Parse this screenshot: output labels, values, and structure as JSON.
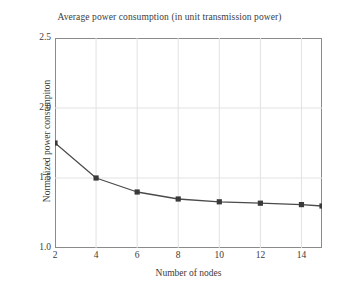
{
  "chart_data": {
    "type": "line",
    "title": "Average power consumption (in unit transmission power)",
    "xlabel": "Number of nodes",
    "ylabel": "Normalized power consumpiton",
    "x": [
      2,
      4,
      6,
      8,
      10,
      12,
      14,
      15
    ],
    "values": [
      1.75,
      1.5,
      1.4,
      1.35,
      1.33,
      1.32,
      1.31,
      1.3
    ],
    "series": [
      {
        "name": "Normalized power consumption",
        "values": [
          1.75,
          1.5,
          1.4,
          1.35,
          1.33,
          1.32,
          1.31,
          1.3
        ]
      }
    ],
    "xlim": [
      2,
      15
    ],
    "ylim": [
      1.0,
      2.5
    ],
    "xticks": [
      2,
      4,
      6,
      8,
      10,
      12,
      14
    ],
    "xtick_labels": [
      "2",
      "4",
      "6",
      "8",
      "10",
      "12",
      "14"
    ],
    "yticks": [
      1.0,
      1.5,
      2.0,
      2.5
    ],
    "ytick_labels": [
      "1.0",
      "1.5",
      "2.0",
      "2.5"
    ],
    "grid": true,
    "legend": false,
    "marker": "square",
    "line_color": "#4a4a4a",
    "marker_color": "#3a3a3a",
    "grid_color": "#e2e2e2",
    "frame_color": "#8a8a8a",
    "background_color": "#ffffff"
  }
}
